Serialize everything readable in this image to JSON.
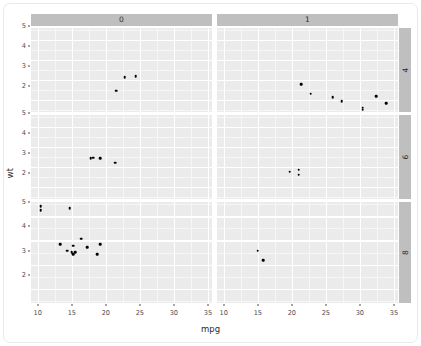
{
  "chart_data": {
    "type": "scatter",
    "title": "",
    "xlabel": "mpg",
    "ylabel": "wt",
    "xlim": [
      9.0,
      35.6
    ],
    "ylim": [
      1.4,
      5.6
    ],
    "xticks": [
      10,
      15,
      20,
      25,
      30,
      35
    ],
    "yticks": [
      2,
      3,
      4,
      5
    ],
    "xtick_labels": [
      "10",
      "15",
      "20",
      "25",
      "30",
      "35"
    ],
    "ytick_labels": [
      "2",
      "3",
      "4",
      "5"
    ],
    "grid": true,
    "legend": "none",
    "facet": {
      "col_variable": "am",
      "row_variable": "cyl",
      "col_levels": [
        "0",
        "1"
      ],
      "row_levels": [
        "4",
        "6",
        "8"
      ]
    },
    "panels": [
      {
        "col": "0",
        "row": "4",
        "points": [
          {
            "x": 21.5,
            "y": 2.465
          },
          {
            "x": 22.8,
            "y": 3.15
          },
          {
            "x": 24.4,
            "y": 3.19
          }
        ]
      },
      {
        "col": "1",
        "row": "4",
        "points": [
          {
            "x": 21.4,
            "y": 2.78
          },
          {
            "x": 22.8,
            "y": 2.32
          },
          {
            "x": 26.0,
            "y": 2.14
          },
          {
            "x": 27.3,
            "y": 1.935
          },
          {
            "x": 30.4,
            "y": 1.615
          },
          {
            "x": 30.4,
            "y": 1.513
          },
          {
            "x": 32.4,
            "y": 2.2
          },
          {
            "x": 33.9,
            "y": 1.835
          }
        ]
      },
      {
        "col": "0",
        "row": "6",
        "points": [
          {
            "x": 17.8,
            "y": 3.44
          },
          {
            "x": 18.1,
            "y": 3.46
          },
          {
            "x": 19.2,
            "y": 3.44
          },
          {
            "x": 21.4,
            "y": 3.215
          }
        ]
      },
      {
        "col": "1",
        "row": "6",
        "points": [
          {
            "x": 19.7,
            "y": 2.77
          },
          {
            "x": 21.0,
            "y": 2.875
          },
          {
            "x": 21.0,
            "y": 2.62
          }
        ]
      },
      {
        "col": "0",
        "row": "8",
        "points": [
          {
            "x": 10.4,
            "y": 5.25
          },
          {
            "x": 10.4,
            "y": 5.424
          },
          {
            "x": 13.3,
            "y": 3.84
          },
          {
            "x": 14.3,
            "y": 3.57
          },
          {
            "x": 14.7,
            "y": 5.345
          },
          {
            "x": 15.0,
            "y": 3.52
          },
          {
            "x": 15.2,
            "y": 3.435
          },
          {
            "x": 15.2,
            "y": 3.78
          },
          {
            "x": 15.5,
            "y": 3.52
          },
          {
            "x": 16.4,
            "y": 4.07
          },
          {
            "x": 17.3,
            "y": 3.73
          },
          {
            "x": 18.7,
            "y": 3.44
          },
          {
            "x": 19.2,
            "y": 3.845
          }
        ]
      },
      {
        "col": "1",
        "row": "8",
        "points": [
          {
            "x": 15.0,
            "y": 3.57
          },
          {
            "x": 15.8,
            "y": 3.17
          }
        ]
      }
    ]
  },
  "strips": {
    "column": [
      {
        "label": "0"
      },
      {
        "label": "1"
      }
    ],
    "row": [
      {
        "label": "4"
      },
      {
        "label": "6"
      },
      {
        "label": "8"
      }
    ]
  },
  "axis": {
    "x_title": "mpg",
    "y_title": "wt",
    "x_labels": [
      "10",
      "15",
      "20",
      "25",
      "30",
      "35"
    ],
    "y_labels": [
      "5",
      "4",
      "3",
      "2"
    ]
  },
  "colors": {
    "panel_background": "#ebebeb",
    "strip_background": "#bfbfbf",
    "gridline_major": "#ffffff",
    "gridline_minor": "#f6f6f6",
    "point": "#000000",
    "text": "#4d4d4d",
    "page_background": "#ffffff",
    "card_border": "#e9e9e9"
  }
}
